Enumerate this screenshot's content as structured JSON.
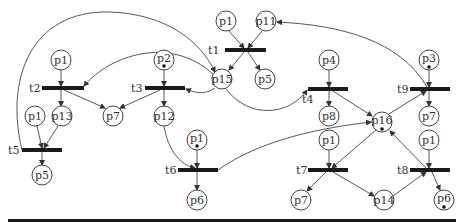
{
  "diagram": {
    "type": "petri-net",
    "places": [
      {
        "id": "pA",
        "label": "p1",
        "x": 226,
        "y": 21,
        "tokens": 0
      },
      {
        "id": "pB",
        "label": "p11",
        "x": 266,
        "y": 21,
        "tokens": 0
      },
      {
        "id": "pC",
        "label": "p15",
        "x": 222,
        "y": 79,
        "tokens": 0
      },
      {
        "id": "pD",
        "label": "p5",
        "x": 265,
        "y": 79,
        "tokens": 0
      },
      {
        "id": "pE",
        "label": "p1",
        "x": 61,
        "y": 60,
        "tokens": 0
      },
      {
        "id": "pF",
        "label": "p2",
        "x": 164,
        "y": 60,
        "tokens": 1
      },
      {
        "id": "pG",
        "label": "p1",
        "x": 35,
        "y": 116,
        "tokens": 0
      },
      {
        "id": "pH",
        "label": "p13",
        "x": 62,
        "y": 116,
        "tokens": 0
      },
      {
        "id": "pI",
        "label": "p7",
        "x": 113,
        "y": 116,
        "tokens": 0
      },
      {
        "id": "pJ",
        "label": "p12",
        "x": 164,
        "y": 116,
        "tokens": 0
      },
      {
        "id": "pK",
        "label": "p5",
        "x": 42,
        "y": 175,
        "tokens": 0
      },
      {
        "id": "pL",
        "label": "p1",
        "x": 197,
        "y": 140,
        "tokens": 1
      },
      {
        "id": "pM",
        "label": "p6",
        "x": 197,
        "y": 200,
        "tokens": 0
      },
      {
        "id": "pN",
        "label": "p4",
        "x": 329,
        "y": 60,
        "tokens": 0
      },
      {
        "id": "pO",
        "label": "p8",
        "x": 329,
        "y": 116,
        "tokens": 0
      },
      {
        "id": "pP",
        "label": "p3",
        "x": 429,
        "y": 60,
        "tokens": 1
      },
      {
        "id": "pQ",
        "label": "p7",
        "x": 429,
        "y": 116,
        "tokens": 0
      },
      {
        "id": "pR",
        "label": "p16",
        "x": 382,
        "y": 122,
        "tokens": 1
      },
      {
        "id": "pS",
        "label": "p1",
        "x": 329,
        "y": 140,
        "tokens": 0
      },
      {
        "id": "pT",
        "label": "p7",
        "x": 301,
        "y": 200,
        "tokens": 0
      },
      {
        "id": "pU",
        "label": "p14",
        "x": 384,
        "y": 200,
        "tokens": 0
      },
      {
        "id": "pV",
        "label": "p1",
        "x": 429,
        "y": 140,
        "tokens": 0
      },
      {
        "id": "pW",
        "label": "p6",
        "x": 444,
        "y": 200,
        "tokens": 1
      }
    ],
    "transitions": [
      {
        "id": "t1",
        "label": "t1",
        "x1": 225,
        "x2": 266,
        "y": 50
      },
      {
        "id": "t2",
        "label": "t2",
        "x1": 42,
        "x2": 84,
        "y": 88
      },
      {
        "id": "t3",
        "label": "t3",
        "x1": 145,
        "x2": 184,
        "y": 88
      },
      {
        "id": "t4",
        "label": "t4",
        "x1": 308,
        "x2": 348,
        "y": 89
      },
      {
        "id": "t5",
        "label": "t5",
        "x1": 22,
        "x2": 62,
        "y": 150
      },
      {
        "id": "t6",
        "label": "t6",
        "x1": 178,
        "x2": 218,
        "y": 170
      },
      {
        "id": "t7",
        "label": "t7",
        "x1": 308,
        "x2": 348,
        "y": 170
      },
      {
        "id": "t8",
        "label": "t8",
        "x1": 410,
        "x2": 450,
        "y": 170
      },
      {
        "id": "t9",
        "label": "t9",
        "x1": 410,
        "x2": 450,
        "y": 89
      }
    ],
    "transition_labels": {
      "t1": "t1",
      "t2": "t2",
      "t3": "t3",
      "t4": "t4",
      "t5": "t5",
      "t6": "t6",
      "t7": "t7",
      "t8": "t8",
      "t9": "t9"
    },
    "place_labels": {
      "pA": "p1",
      "pB": "p11",
      "pC": "p15",
      "pD": "p5",
      "pE": "p1",
      "pF": "p2",
      "pG": "p1",
      "pH": "p13",
      "pI": "p7",
      "pJ": "p12",
      "pK": "p5",
      "pL": "p1",
      "pM": "p6",
      "pN": "p4",
      "pO": "p8",
      "pP": "p3",
      "pQ": "p7",
      "pR": "p16",
      "pS": "p1",
      "pT": "p7",
      "pU": "p14",
      "pV": "p1",
      "pW": "p6"
    },
    "arcs": [
      {
        "from": "p1",
        "to": "t1"
      },
      {
        "from": "p11",
        "to": "t1"
      },
      {
        "from": "t1",
        "to": "p15"
      },
      {
        "from": "t1",
        "to": "p5"
      },
      {
        "from": "p1",
        "to": "t2"
      },
      {
        "from": "t2",
        "to": "p13"
      },
      {
        "from": "t2",
        "to": "p7"
      },
      {
        "from": "p15",
        "to": "t2"
      },
      {
        "from": "p2",
        "to": "t3"
      },
      {
        "from": "t3",
        "to": "p12"
      },
      {
        "from": "t3",
        "to": "p7"
      },
      {
        "from": "p15",
        "to": "t3"
      },
      {
        "from": "p15",
        "to": "t4"
      },
      {
        "from": "p4",
        "to": "t4"
      },
      {
        "from": "t4",
        "to": "p8"
      },
      {
        "from": "t4",
        "to": "p16"
      },
      {
        "from": "p1",
        "to": "t5"
      },
      {
        "from": "p13",
        "to": "t5"
      },
      {
        "from": "t5",
        "to": "p5"
      },
      {
        "from": "t5",
        "to": "p15"
      },
      {
        "from": "p12",
        "to": "t6"
      },
      {
        "from": "p1",
        "to": "t6"
      },
      {
        "from": "t6",
        "to": "p6"
      },
      {
        "from": "t6",
        "to": "p16"
      },
      {
        "from": "p1",
        "to": "t7"
      },
      {
        "from": "p16",
        "to": "t7"
      },
      {
        "from": "t7",
        "to": "p7"
      },
      {
        "from": "t7",
        "to": "p14"
      },
      {
        "from": "p1",
        "to": "t8"
      },
      {
        "from": "p14",
        "to": "t8"
      },
      {
        "from": "t8",
        "to": "p16"
      },
      {
        "from": "t8",
        "to": "p6"
      },
      {
        "from": "p3",
        "to": "t9"
      },
      {
        "from": "t9",
        "to": "p7"
      },
      {
        "from": "p16",
        "to": "t9"
      },
      {
        "from": "t9",
        "to": "p11"
      }
    ]
  }
}
